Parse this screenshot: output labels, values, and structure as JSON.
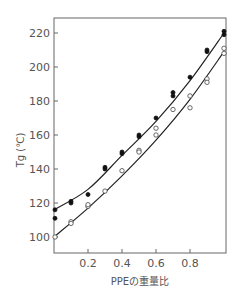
{
  "chart_data": {
    "type": "scatter",
    "title": "",
    "xlabel": "PPEの重量比",
    "ylabel": "Tg (℃)",
    "xlim": [
      0,
      1.0
    ],
    "ylim": [
      90,
      230
    ],
    "x_ticks": [
      0.2,
      0.4,
      0.6,
      0.8
    ],
    "x_tick_labels": [
      "0.2",
      "0.4",
      "0.6",
      "0.8"
    ],
    "y_ticks": [
      100,
      120,
      140,
      160,
      180,
      200,
      220
    ],
    "y_tick_labels": [
      "100",
      "120",
      "140",
      "160",
      "180",
      "200",
      "220"
    ],
    "grid": false,
    "legend": null,
    "series": [
      {
        "name": "filled markers",
        "marker": "filled-circle",
        "points": [
          [
            0,
            116
          ],
          [
            0,
            111
          ],
          [
            0.1,
            121
          ],
          [
            0.1,
            120
          ],
          [
            0.2,
            125
          ],
          [
            0.3,
            140
          ],
          [
            0.3,
            141
          ],
          [
            0.4,
            149
          ],
          [
            0.4,
            150
          ],
          [
            0.5,
            159
          ],
          [
            0.5,
            160
          ],
          [
            0.6,
            170
          ],
          [
            0.7,
            183
          ],
          [
            0.7,
            185
          ],
          [
            0.8,
            194
          ],
          [
            0.9,
            209
          ],
          [
            0.9,
            210
          ],
          [
            1.0,
            219
          ],
          [
            1.0,
            221
          ]
        ],
        "fit_curve": [
          [
            0,
            116
          ],
          [
            0.2,
            128
          ],
          [
            0.4,
            148
          ],
          [
            0.6,
            168
          ],
          [
            0.8,
            192
          ],
          [
            1.0,
            220
          ]
        ]
      },
      {
        "name": "open markers",
        "marker": "open-circle",
        "points": [
          [
            0,
            100
          ],
          [
            0.1,
            109
          ],
          [
            0.1,
            108
          ],
          [
            0.2,
            118
          ],
          [
            0.2,
            119
          ],
          [
            0.3,
            127
          ],
          [
            0.4,
            139
          ],
          [
            0.5,
            151
          ],
          [
            0.5,
            150
          ],
          [
            0.6,
            160
          ],
          [
            0.6,
            164
          ],
          [
            0.7,
            175
          ],
          [
            0.8,
            183
          ],
          [
            0.8,
            176
          ],
          [
            0.9,
            193
          ],
          [
            0.9,
            191
          ],
          [
            1.0,
            211
          ],
          [
            1.0,
            208
          ]
        ],
        "fit_curve": [
          [
            0,
            100
          ],
          [
            0.2,
            117
          ],
          [
            0.4,
            136
          ],
          [
            0.6,
            157
          ],
          [
            0.8,
            181
          ],
          [
            1.0,
            209
          ]
        ]
      }
    ]
  },
  "labels": {
    "ylabel": "Tg (℃)",
    "xlabel": "PPEの重量比"
  }
}
